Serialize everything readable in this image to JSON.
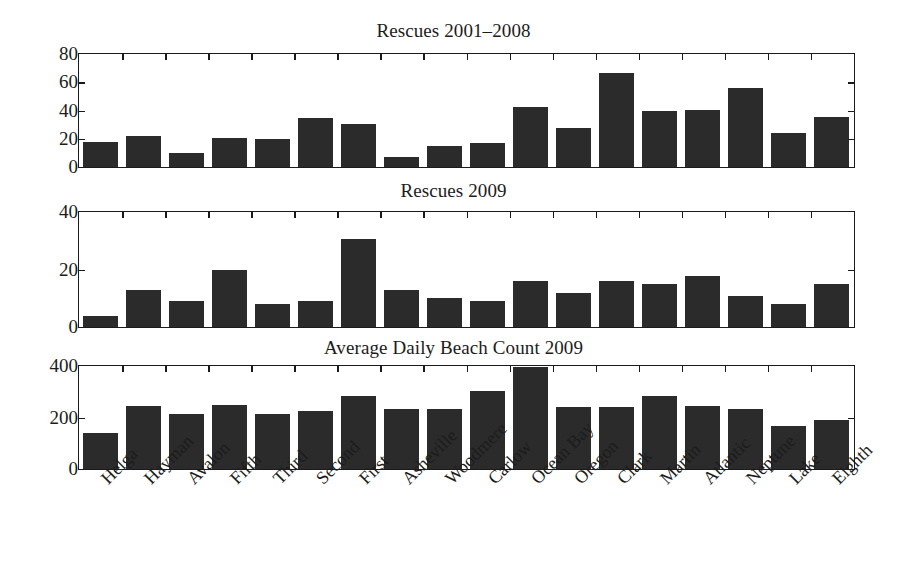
{
  "figure": {
    "background": "#ffffff",
    "bar_color": "#2b2b2b",
    "axis_color": "#1a1a1a"
  },
  "categories": [
    "Helga",
    "Hayman",
    "Avalon",
    "Fifth",
    "Third",
    "Second",
    "First",
    "Asheville",
    "Woodmere",
    "Carlow",
    "Ocean Bay",
    "Oregon",
    "Clark",
    "Martin",
    "Atlantic",
    "Neptune",
    "Lake",
    "Eighth"
  ],
  "panels": [
    {
      "title": "Rescues 2001–2008",
      "ylim": [
        0,
        80
      ],
      "yticks": [
        0,
        20,
        40,
        60,
        80
      ],
      "ytick_labels": [
        "0",
        "20",
        "40",
        "60",
        "80"
      ]
    },
    {
      "title": "Rescues 2009",
      "ylim": [
        0,
        40
      ],
      "yticks": [
        0,
        20,
        40
      ],
      "ytick_labels": [
        "0",
        "20",
        "40"
      ]
    },
    {
      "title": "Average Daily Beach Count 2009",
      "ylim": [
        0,
        400
      ],
      "yticks": [
        0,
        200,
        400
      ],
      "ytick_labels": [
        "0",
        "200",
        "400"
      ]
    }
  ],
  "chart_data": [
    {
      "type": "bar",
      "title": "Rescues 2001–2008",
      "xlabel": "",
      "ylabel": "",
      "ylim": [
        0,
        80
      ],
      "yticks": [
        0,
        20,
        40,
        60,
        80
      ],
      "grid": false,
      "legend": "none",
      "categories": [
        "Helga",
        "Hayman",
        "Avalon",
        "Fifth",
        "Third",
        "Second",
        "First",
        "Asheville",
        "Woodmere",
        "Carlow",
        "Ocean Bay",
        "Oregon",
        "Clark",
        "Martin",
        "Atlantic",
        "Neptune",
        "Lake",
        "Eighth"
      ],
      "values": [
        18,
        22,
        10,
        21,
        20,
        35,
        31,
        7,
        15,
        17,
        43,
        28,
        67,
        40,
        41,
        56,
        24,
        36
      ]
    },
    {
      "type": "bar",
      "title": "Rescues 2009",
      "xlabel": "",
      "ylabel": "",
      "ylim": [
        0,
        40
      ],
      "yticks": [
        0,
        20,
        40
      ],
      "grid": false,
      "legend": "none",
      "categories": [
        "Helga",
        "Hayman",
        "Avalon",
        "Fifth",
        "Third",
        "Second",
        "First",
        "Asheville",
        "Woodmere",
        "Carlow",
        "Ocean Bay",
        "Oregon",
        "Clark",
        "Martin",
        "Atlantic",
        "Neptune",
        "Lake",
        "Eighth"
      ],
      "values": [
        4,
        13,
        9,
        20,
        8,
        9,
        31,
        13,
        10,
        9,
        16,
        12,
        16,
        15,
        18,
        11,
        8,
        15
      ]
    },
    {
      "type": "bar",
      "title": "Average Daily Beach Count 2009",
      "xlabel": "",
      "ylabel": "",
      "ylim": [
        0,
        400
      ],
      "yticks": [
        0,
        200,
        400
      ],
      "grid": false,
      "legend": "none",
      "categories": [
        "Helga",
        "Hayman",
        "Avalon",
        "Fifth",
        "Third",
        "Second",
        "First",
        "Asheville",
        "Woodmere",
        "Carlow",
        "Ocean Bay",
        "Oregon",
        "Clark",
        "Martin",
        "Atlantic",
        "Neptune",
        "Lake",
        "Eighth"
      ],
      "values": [
        140,
        248,
        215,
        250,
        215,
        228,
        285,
        235,
        233,
        305,
        410,
        243,
        243,
        287,
        248,
        235,
        170,
        192
      ],
      "notes": "Ocean Bay bar (410) exceeds the axis maximum of 400 and is visually clipped at the top of the frame."
    }
  ]
}
